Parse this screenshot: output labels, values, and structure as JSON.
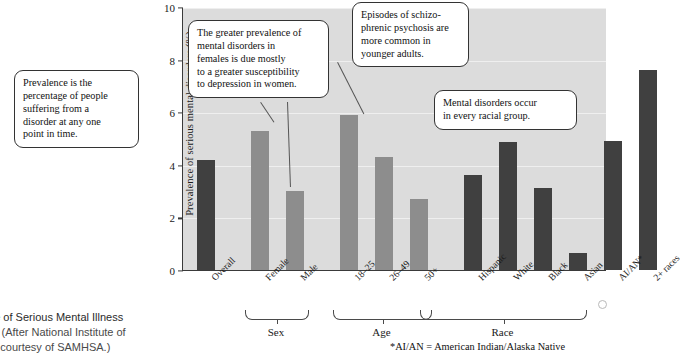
{
  "chart_data": {
    "type": "bar",
    "xlabel": "",
    "ylabel": "Prevalence of serious mental disorders (%)",
    "ylim": [
      0,
      10
    ],
    "yticks": [
      "0",
      "2",
      "4",
      "6",
      "8",
      "10"
    ],
    "grid": true,
    "legend": "none",
    "categories": [
      "Overall",
      "Female",
      "Male",
      "18–25",
      "26–49",
      "50+",
      "Hispanic",
      "White",
      "Black",
      "Asian",
      "AI/AN*",
      "2+ races"
    ],
    "values": [
      4.2,
      5.3,
      3.0,
      5.9,
      4.3,
      2.7,
      3.6,
      4.85,
      3.1,
      0.65,
      4.9,
      7.6
    ],
    "bar_colors": [
      "#404040",
      "#8d8d8d",
      "#8d8d8d",
      "#8d8d8d",
      "#8d8d8d",
      "#8d8d8d",
      "#404040",
      "#404040",
      "#404040",
      "#404040",
      "#404040",
      "#404040"
    ],
    "groups": [
      {
        "label": "Sex",
        "categories": [
          "Female",
          "Male"
        ]
      },
      {
        "label": "Age",
        "categories": [
          "18–25",
          "26–49",
          "50+"
        ]
      },
      {
        "label": "Race",
        "categories": [
          "Hispanic",
          "White",
          "Black",
          "Asian",
          "AI/AN*",
          "2+ races"
        ]
      }
    ],
    "annotations": [
      "Prevalence is the percentage of people suffering from a disorder at any one point in time.",
      "The greater prevalence of mental disorders in females is due mostly to a greater susceptibility to depression in women.",
      "Episodes of schizo-phrenic psychosis are more common in younger adults.",
      "Mental disorders occur in every racial group."
    ],
    "footnote": "*AI/AN = American Indian/Alaska Native"
  },
  "axis": {
    "y_label": "Prevalence of serious mental disorders (%)",
    "y_ticks": [
      "10",
      "8",
      "6",
      "4",
      "2",
      "0"
    ]
  },
  "callouts": {
    "prevalence": {
      "line1": "Prevalence is the",
      "line2": "percentage of people",
      "line3": "suffering from a",
      "line4": "disorder at any one",
      "line5": "point in time."
    },
    "females": {
      "line1": "The greater prevalence of",
      "line2": "mental disorders in",
      "line3": "females is due mostly",
      "line4": "to a greater susceptibility",
      "line5": "to depression in women."
    },
    "schizophrenia": {
      "line1": "Episodes of schizo-",
      "line2": "phrenic psychosis are",
      "line3": "more common in",
      "line4": "younger adults."
    },
    "racial": {
      "line1": "Mental disorders occur",
      "line2": "in every racial group."
    }
  },
  "bars": [
    {
      "label": "Overall",
      "value": 4.2,
      "shade": "dark"
    },
    {
      "label": "Female",
      "value": 5.3,
      "shade": "light"
    },
    {
      "label": "Male",
      "value": 3.0,
      "shade": "light"
    },
    {
      "label": "18–25",
      "value": 5.9,
      "shade": "light"
    },
    {
      "label": "26–49",
      "value": 4.3,
      "shade": "light"
    },
    {
      "label": "50+",
      "value": 2.7,
      "shade": "light"
    },
    {
      "label": "Hispanic",
      "value": 3.6,
      "shade": "dark"
    },
    {
      "label": "White",
      "value": 4.85,
      "shade": "dark"
    },
    {
      "label": "Black",
      "value": 3.1,
      "shade": "dark"
    },
    {
      "label": "Asian",
      "value": 0.65,
      "shade": "dark"
    },
    {
      "label": "AI/AN*",
      "value": 4.9,
      "shade": "dark"
    },
    {
      "label": "2+ races",
      "value": 7.6,
      "shade": "dark"
    }
  ],
  "groups": {
    "sex": "Sex",
    "age": "Age",
    "race": "Race"
  },
  "footnote": "*AI/AN = American Indian/Alaska Native",
  "caption": {
    "line1": "lence of Serious Mental Illness",
    "line2_bold": "2016",
    "line2_rest": "(After National Institute of",
    "line3": "Data courtesy of SAMHSA.)"
  }
}
